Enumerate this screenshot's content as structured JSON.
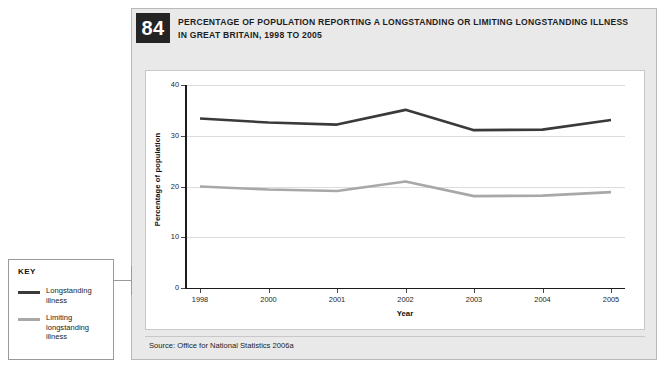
{
  "figure": {
    "number": "84",
    "title_line1": "PERCENTAGE OF POPULATION REPORTING A LONGSTANDING OR LIMITING LONGSTANDING ILLNESS",
    "title_line2": "IN GREAT BRITAIN, 1998 TO 2005",
    "source": "Source: Office for National Statistics 2006a"
  },
  "key": {
    "heading": "KEY",
    "entries": [
      {
        "label": "Longstanding illness",
        "color": "#3a3a3a"
      },
      {
        "label": "Limiting longstanding illness",
        "color": "#a8a8a8"
      }
    ]
  },
  "chart_data": {
    "type": "line",
    "title": "PERCENTAGE OF POPULATION REPORTING A LONGSTANDING OR LIMITING LONGSTANDING ILLNESS IN GREAT BRITAIN, 1998 TO 2005",
    "xlabel": "Year",
    "ylabel": "Percentage of population",
    "categories": [
      "1998",
      "2000",
      "2001",
      "2002",
      "2003",
      "2004",
      "2005"
    ],
    "ylim": [
      0,
      40
    ],
    "yticks": [
      0,
      10,
      20,
      30,
      40
    ],
    "ytick_labels": [
      "0",
      "10",
      "20",
      "30",
      "40"
    ],
    "grid": true,
    "legend_position": "external-left",
    "series": [
      {
        "name": "Longstanding illness",
        "color": "#3a3a3a",
        "values": [
          33.4,
          32.6,
          32.2,
          35.1,
          31.1,
          31.2,
          33.1
        ]
      },
      {
        "name": "Limiting longstanding illness",
        "color": "#a8a8a8",
        "values": [
          20.0,
          19.4,
          19.1,
          21.0,
          18.1,
          18.2,
          18.9
        ]
      }
    ]
  }
}
